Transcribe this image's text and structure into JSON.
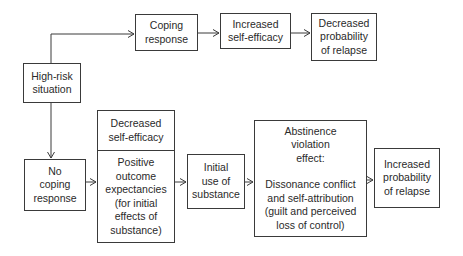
{
  "diagram": {
    "type": "flowchart",
    "nodes": {
      "high_risk": "High-risk\nsituation",
      "coping": "Coping\nresponse",
      "inc_self_efficacy": "Increased\nself-efficacy",
      "dec_prob_relapse": "Decreased\nprobability\nof relapse",
      "no_coping": "No\ncoping\nresponse",
      "dec_self_efficacy": "Decreased\nself-efficacy",
      "positive_outcome": "Positive\noutcome\nexpectancies\n(for initial\neffects of\nsubstance)",
      "initial_use": "Initial\nuse of\nsubstance",
      "ave_title": "Abstinence\nviolation\neffect:",
      "ave_body": "Dissonance conflict\nand self-attribution\n(guilt and perceived\nloss of control)",
      "inc_prob_relapse": "Increased\nprobability\nof relapse"
    },
    "edges": [
      {
        "from": "High-risk situation",
        "to": "Coping response"
      },
      {
        "from": "Coping response",
        "to": "Increased self-efficacy"
      },
      {
        "from": "Increased self-efficacy",
        "to": "Decreased probability of relapse"
      },
      {
        "from": "High-risk situation",
        "to": "No coping response"
      },
      {
        "from": "No coping response",
        "to": "Decreased self-efficacy / Positive outcome expectancies"
      },
      {
        "from": "Decreased self-efficacy / Positive outcome expectancies",
        "to": "Initial use of substance"
      },
      {
        "from": "Initial use of substance",
        "to": "Abstinence violation effect"
      },
      {
        "from": "Abstinence violation effect",
        "to": "Increased probability of relapse"
      }
    ]
  }
}
